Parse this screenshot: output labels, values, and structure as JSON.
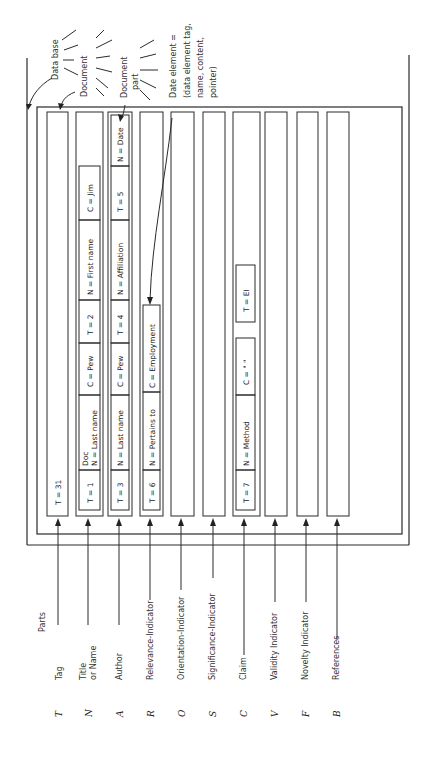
{
  "diagram": {
    "orientation": "rotated 90 degrees counter-clockwise",
    "annotations": {
      "database": "Data base",
      "document": "Document",
      "document_part": "Document part",
      "data_element_line1": "Date element =",
      "data_element_line2": "(data element tag,",
      "data_element_line3": "name, content,",
      "data_element_line4": "pointer)"
    },
    "parts_header": "Parts",
    "parts": [
      {
        "letter": "T",
        "label": "Tag",
        "label2": ""
      },
      {
        "letter": "N",
        "label": "Title",
        "label2": "or Name"
      },
      {
        "letter": "A",
        "label": "Author",
        "label2": ""
      },
      {
        "letter": "R",
        "label": "Relevance-Indicator",
        "label2": ""
      },
      {
        "letter": "O",
        "label": "Orientation-Indicator",
        "label2": ""
      },
      {
        "letter": "S",
        "label": "Significance-Indicator",
        "label2": ""
      },
      {
        "letter": "C",
        "label": "Claim",
        "label2": ""
      },
      {
        "letter": "V",
        "label": "Validity Indicator",
        "label2": ""
      },
      {
        "letter": "F",
        "label": "Novelty Indicator",
        "label2": ""
      },
      {
        "letter": "B",
        "label": "References",
        "label2": ""
      }
    ],
    "strips": {
      "tag": {
        "cells": [
          "T = 31"
        ]
      },
      "title": {
        "cells": [
          "T = 1",
          "Doc",
          "N = Last name",
          "C = Pew",
          "T = 2",
          "N = First name",
          "C = Jim"
        ]
      },
      "author": {
        "cells": [
          "T = 3",
          "N = Last name",
          "C = Pew",
          "T = 4",
          "N = Affiliation",
          "T = 5",
          "N = Date"
        ]
      },
      "relevance": {
        "cells": [
          "T = 6",
          "N = Pertains to",
          "C = Employment"
        ]
      },
      "claim": {
        "cells": [
          "T = 7",
          "N = Method",
          "C = \"  \"",
          "T = EI"
        ]
      }
    }
  }
}
